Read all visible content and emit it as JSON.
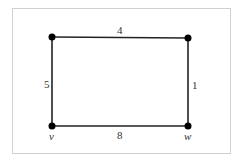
{
  "graph": {
    "vertices": [
      {
        "id": "top-left",
        "label": "",
        "x": 52,
        "y": 37
      },
      {
        "id": "top-right",
        "label": "",
        "x": 188,
        "y": 38
      },
      {
        "id": "v",
        "label": "v",
        "x": 52,
        "y": 126
      },
      {
        "id": "w",
        "label": "w",
        "x": 188,
        "y": 126
      }
    ],
    "edges": [
      {
        "from": "top-left",
        "to": "top-right",
        "weight": "4"
      },
      {
        "from": "top-left",
        "to": "v",
        "weight": "5"
      },
      {
        "from": "top-right",
        "to": "w",
        "weight": "1"
      },
      {
        "from": "v",
        "to": "w",
        "weight": "8"
      }
    ]
  },
  "colors": {
    "edge": "#222222",
    "vertex": "#000000",
    "frame": "#d0d0d0"
  }
}
